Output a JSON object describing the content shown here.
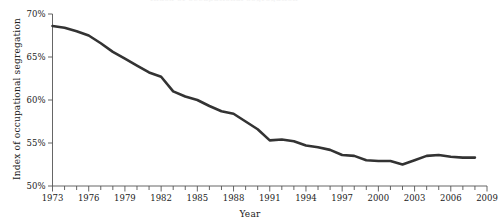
{
  "figure": {
    "clipped_header_text": "Index of occupational segregation",
    "background_color": "#ffffff",
    "line_color": "#333333",
    "axis_color": "#555555"
  },
  "chart_data": {
    "type": "line",
    "title": "",
    "xlabel": "Year",
    "ylabel": "Index of occupational segregation",
    "xlim": [
      1973,
      2009
    ],
    "ylim": [
      50,
      70
    ],
    "grid": false,
    "legend": null,
    "ytick_labels": [
      "70%",
      "65%",
      "60%",
      "55%",
      "50%"
    ],
    "ytick_values": [
      70,
      65,
      60,
      55,
      50
    ],
    "xtick_labels": [
      "1973",
      "1976",
      "1979",
      "1982",
      "1985",
      "1988",
      "1991",
      "1994",
      "1997",
      "2000",
      "2003",
      "2006",
      "2009"
    ],
    "xtick_values": [
      1973,
      1976,
      1979,
      1982,
      1985,
      1988,
      1991,
      1994,
      1997,
      2000,
      2003,
      2006,
      2009
    ],
    "minor_xticks": [
      1974,
      1975,
      1977,
      1978,
      1980,
      1981,
      1983,
      1984,
      1986,
      1987,
      1989,
      1990,
      1992,
      1993,
      1995,
      1996,
      1998,
      1999,
      2001,
      2002,
      2004,
      2005,
      2007,
      2008
    ],
    "series": [
      {
        "name": "Index of occupational segregation",
        "x": [
          1973,
          1974,
          1975,
          1976,
          1977,
          1978,
          1979,
          1980,
          1981,
          1982,
          1983,
          1984,
          1985,
          1986,
          1987,
          1988,
          1989,
          1990,
          1991,
          1992,
          1993,
          1994,
          1995,
          1996,
          1997,
          1998,
          1999,
          2000,
          2001,
          2002,
          2003,
          2004,
          2005,
          2006,
          2007,
          2008
        ],
        "values": [
          68.6,
          68.4,
          68.0,
          67.5,
          66.6,
          65.6,
          64.8,
          64.0,
          63.2,
          62.7,
          61.0,
          60.4,
          60.0,
          59.3,
          58.7,
          58.4,
          57.5,
          56.6,
          55.3,
          55.4,
          55.2,
          54.7,
          54.5,
          54.2,
          53.6,
          53.5,
          53.0,
          52.9,
          52.9,
          52.5,
          53.0,
          53.5,
          53.6,
          53.4,
          53.3,
          53.3
        ]
      }
    ]
  }
}
